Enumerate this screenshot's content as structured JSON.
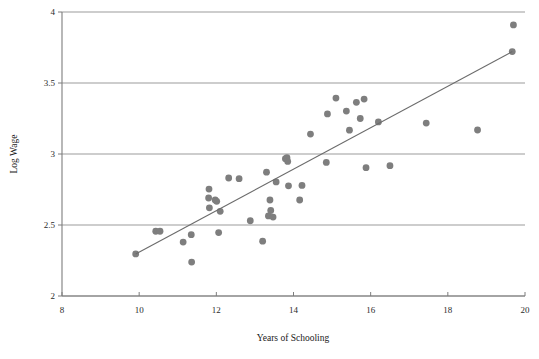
{
  "chart_data": {
    "type": "scatter",
    "title": "",
    "xlabel": "Years of Schooling",
    "ylabel": "Log Wage",
    "xlim": [
      8,
      20
    ],
    "ylim": [
      2,
      4
    ],
    "xticks": [
      8,
      10,
      12,
      14,
      16,
      18,
      20
    ],
    "yticks": [
      2,
      2.5,
      3,
      3.5,
      4
    ],
    "xtick_labels": [
      "8",
      "10",
      "12",
      "14",
      "16",
      "18",
      "20"
    ],
    "ytick_labels": [
      "2",
      "2.5",
      "3",
      "3.5",
      "4"
    ],
    "grid": "horizontal",
    "legend": "none",
    "point_color": "#7e7e7e",
    "line_color": "#6b6b6b",
    "axis_color": "#7d7d7d",
    "marker_radius": 3.4,
    "x": [
      9.91,
      10.43,
      10.54,
      11.14,
      11.35,
      11.36,
      11.8,
      11.81,
      11.82,
      11.97,
      12.01,
      12.06,
      12.1,
      12.32,
      12.59,
      12.88,
      13.2,
      13.3,
      13.35,
      13.39,
      13.41,
      13.47,
      13.55,
      13.79,
      13.83,
      13.85,
      13.87,
      14.16,
      14.22,
      14.44,
      14.85,
      14.88,
      15.1,
      15.37,
      15.45,
      15.63,
      15.73,
      15.83,
      15.88,
      16.2,
      16.5,
      17.44,
      18.77,
      19.67,
      19.7
    ],
    "y": [
      2.296,
      2.456,
      2.456,
      2.38,
      2.432,
      2.239,
      2.69,
      2.753,
      2.621,
      2.676,
      2.667,
      2.447,
      2.596,
      2.831,
      2.826,
      2.53,
      2.386,
      2.872,
      2.564,
      2.676,
      2.602,
      2.556,
      2.803,
      2.967,
      2.974,
      2.948,
      2.776,
      2.676,
      2.779,
      3.14,
      2.941,
      3.282,
      3.394,
      3.302,
      3.168,
      3.364,
      3.25,
      3.387,
      2.904,
      3.226,
      2.918,
      3.218,
      3.169,
      3.721,
      3.909
    ],
    "fit_line": {
      "label": "regression line",
      "x0": 9.91,
      "y0": 2.296,
      "x1": 19.67,
      "y1": 3.721
    }
  },
  "axis": {
    "y_title": "Log Wage",
    "x_title": "Years of Schooling"
  }
}
